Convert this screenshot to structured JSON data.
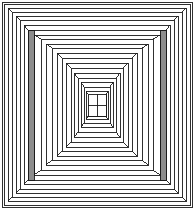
{
  "figure": {
    "type": "line-drawing",
    "canvas": {
      "width": 194,
      "height": 209
    },
    "background_color": "#ffffff",
    "stroke_color": "#1a1a1a",
    "shade_color": "#8c8c8c",
    "stroke_width": 0.9,
    "frame_count": 11,
    "frames": [
      {
        "index": 0,
        "x": 4,
        "y": 4,
        "width": 186,
        "height": 201,
        "shaded": false
      },
      {
        "index": 1,
        "x": 12,
        "y": 12,
        "width": 170,
        "height": 185,
        "shaded": false
      },
      {
        "index": 2,
        "x": 20,
        "y": 20,
        "width": 154,
        "height": 169,
        "shaded": false
      },
      {
        "index": 3,
        "x": 28,
        "y": 30,
        "width": 138,
        "height": 150,
        "shaded": true
      },
      {
        "index": 4,
        "x": 41,
        "y": 39,
        "width": 112,
        "height": 131,
        "shaded": false
      },
      {
        "index": 5,
        "x": 52,
        "y": 48,
        "width": 90,
        "height": 112,
        "shaded": false
      },
      {
        "index": 6,
        "x": 62,
        "y": 58,
        "width": 70,
        "height": 93,
        "shaded": false
      },
      {
        "index": 7,
        "x": 71,
        "y": 68,
        "width": 52,
        "height": 74,
        "shaded": false
      },
      {
        "index": 8,
        "x": 78,
        "y": 78,
        "width": 38,
        "height": 54,
        "shaded": false
      },
      {
        "index": 9,
        "x": 84,
        "y": 87,
        "width": 26,
        "height": 36,
        "shaded": false
      },
      {
        "index": 10,
        "x": 88,
        "y": 94,
        "width": 18,
        "height": 22,
        "shaded": false
      }
    ],
    "inner_frames": [
      {
        "index": 0,
        "x": 8,
        "y": 8,
        "width": 178,
        "height": 193
      },
      {
        "index": 1,
        "x": 16,
        "y": 16,
        "width": 162,
        "height": 177
      },
      {
        "index": 2,
        "x": 24,
        "y": 25,
        "width": 146,
        "height": 159
      },
      {
        "index": 3,
        "x": 34,
        "y": 35,
        "width": 126,
        "height": 140
      },
      {
        "index": 4,
        "x": 46,
        "y": 44,
        "width": 102,
        "height": 121
      },
      {
        "index": 5,
        "x": 57,
        "y": 53,
        "width": 80,
        "height": 103
      },
      {
        "index": 6,
        "x": 66,
        "y": 63,
        "width": 62,
        "height": 84
      },
      {
        "index": 7,
        "x": 74,
        "y": 73,
        "width": 46,
        "height": 64
      },
      {
        "index": 8,
        "x": 81,
        "y": 82,
        "width": 32,
        "height": 45
      },
      {
        "index": 9,
        "x": 86,
        "y": 91,
        "width": 22,
        "height": 28
      }
    ],
    "shaded_panels": [
      {
        "name": "left-gray-panel",
        "x": 28,
        "y": 30,
        "width": 6,
        "height": 150
      },
      {
        "name": "right-gray-panel",
        "x": 160,
        "y": 30,
        "width": 6,
        "height": 150
      }
    ],
    "core": {
      "name": "innermost-cell",
      "x": 88,
      "y": 94,
      "width": 18,
      "height": 22,
      "divider_vertical_x": 97,
      "divider_horizontal_y": 105,
      "note": "Small H-shaped division at the vanishing point"
    },
    "outer_border": {
      "x": 2,
      "y": 2,
      "width": 190,
      "height": 205
    }
  }
}
